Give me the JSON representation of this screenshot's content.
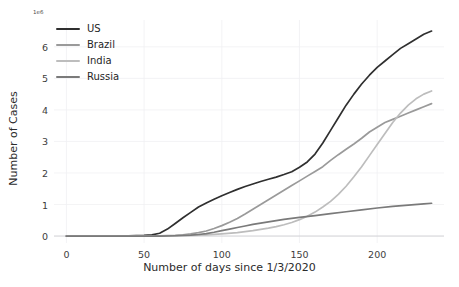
{
  "chart_data": {
    "type": "line",
    "title": "",
    "xlabel": "Number of days since 1/3/2020",
    "ylabel": "Number of Cases",
    "y_offset_text": "1e6",
    "y_scale_factor": 1000000,
    "xlim": [
      -8,
      243
    ],
    "ylim": [
      -0.22,
      6.85
    ],
    "xticks": [
      0,
      50,
      100,
      150,
      200
    ],
    "xtick_labels": [
      "0",
      "50",
      "100",
      "150",
      "200"
    ],
    "yticks": [
      0,
      1,
      2,
      3,
      4,
      5,
      6
    ],
    "ytick_labels": [
      "0",
      "1",
      "2",
      "3",
      "4",
      "5",
      "6"
    ],
    "grid": true,
    "legend_position": "upper left",
    "series": [
      {
        "name": "US",
        "color": "#2f2f2f",
        "x": [
          0,
          10,
          20,
          30,
          40,
          50,
          55,
          60,
          65,
          70,
          75,
          80,
          85,
          90,
          95,
          100,
          105,
          110,
          115,
          120,
          125,
          130,
          135,
          140,
          145,
          150,
          155,
          160,
          165,
          170,
          175,
          180,
          185,
          190,
          195,
          200,
          205,
          210,
          215,
          220,
          225,
          230,
          235
        ],
        "values": [
          0.0,
          0.0,
          0.0,
          0.0,
          0.01,
          0.02,
          0.04,
          0.09,
          0.22,
          0.4,
          0.58,
          0.75,
          0.92,
          1.05,
          1.17,
          1.28,
          1.38,
          1.48,
          1.57,
          1.65,
          1.73,
          1.8,
          1.87,
          1.95,
          2.04,
          2.18,
          2.35,
          2.6,
          2.95,
          3.35,
          3.75,
          4.15,
          4.5,
          4.82,
          5.1,
          5.35,
          5.55,
          5.75,
          5.95,
          6.1,
          6.25,
          6.4,
          6.5
        ]
      },
      {
        "name": "Brazil",
        "color": "#9a9a9a",
        "x": [
          0,
          10,
          20,
          30,
          40,
          50,
          60,
          70,
          75,
          80,
          85,
          90,
          95,
          100,
          105,
          110,
          115,
          120,
          125,
          130,
          135,
          140,
          145,
          150,
          155,
          160,
          165,
          170,
          175,
          180,
          185,
          190,
          195,
          200,
          205,
          210,
          215,
          220,
          225,
          230,
          235
        ],
        "values": [
          0.0,
          0.0,
          0.0,
          0.0,
          0.0,
          0.0,
          0.01,
          0.02,
          0.04,
          0.07,
          0.11,
          0.16,
          0.24,
          0.33,
          0.44,
          0.56,
          0.7,
          0.85,
          1.0,
          1.15,
          1.3,
          1.45,
          1.6,
          1.75,
          1.9,
          2.05,
          2.2,
          2.4,
          2.58,
          2.75,
          2.92,
          3.1,
          3.3,
          3.45,
          3.6,
          3.7,
          3.8,
          3.9,
          4.0,
          4.1,
          4.2
        ]
      },
      {
        "name": "India",
        "color": "#bdbdbd",
        "x": [
          0,
          10,
          20,
          30,
          40,
          50,
          60,
          70,
          80,
          90,
          100,
          110,
          120,
          130,
          135,
          140,
          145,
          150,
          155,
          160,
          165,
          170,
          175,
          180,
          185,
          190,
          195,
          200,
          205,
          210,
          215,
          220,
          225,
          230,
          235
        ],
        "values": [
          0.0,
          0.0,
          0.0,
          0.0,
          0.0,
          0.0,
          0.0,
          0.01,
          0.02,
          0.04,
          0.07,
          0.11,
          0.17,
          0.25,
          0.3,
          0.36,
          0.43,
          0.52,
          0.63,
          0.76,
          0.92,
          1.1,
          1.32,
          1.58,
          1.88,
          2.2,
          2.55,
          2.9,
          3.25,
          3.6,
          3.9,
          4.15,
          4.35,
          4.5,
          4.6
        ]
      },
      {
        "name": "Russia",
        "color": "#7a7a7a",
        "x": [
          0,
          10,
          20,
          30,
          40,
          50,
          60,
          70,
          80,
          85,
          90,
          95,
          100,
          105,
          110,
          115,
          120,
          125,
          130,
          135,
          140,
          145,
          150,
          160,
          170,
          180,
          190,
          200,
          210,
          220,
          230,
          235
        ],
        "values": [
          0.0,
          0.0,
          0.0,
          0.0,
          0.0,
          0.0,
          0.0,
          0.01,
          0.03,
          0.05,
          0.08,
          0.12,
          0.17,
          0.22,
          0.27,
          0.32,
          0.37,
          0.41,
          0.45,
          0.49,
          0.53,
          0.56,
          0.59,
          0.65,
          0.71,
          0.77,
          0.83,
          0.89,
          0.94,
          0.98,
          1.02,
          1.04
        ]
      }
    ]
  }
}
